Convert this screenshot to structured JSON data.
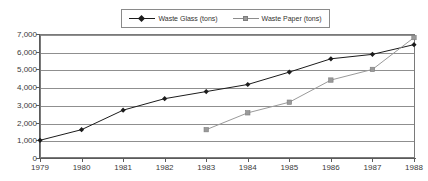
{
  "legend": {
    "position": "top-center",
    "entries": [
      {
        "label": "Waste Glass (tons)",
        "marker": "diamond-marker-icon",
        "color": "#1c1c1c"
      },
      {
        "label": "Waste Paper (tons)",
        "marker": "square-marker-icon",
        "color": "#9a9a9a"
      }
    ]
  },
  "chart_data": {
    "type": "line",
    "title": "",
    "subtitle": "",
    "xlabel": "",
    "ylabel": "",
    "x": [
      1979,
      1980,
      1981,
      1982,
      1983,
      1984,
      1985,
      1986,
      1987,
      1988
    ],
    "categories": [
      "1979",
      "1980",
      "1981",
      "1982",
      "1983",
      "1984",
      "1985",
      "1986",
      "1987",
      "1988"
    ],
    "xlim": [
      1979,
      1988
    ],
    "ylim": [
      0,
      7000
    ],
    "ytick_values": [
      0,
      1000,
      2000,
      3000,
      4000,
      5000,
      6000,
      7000
    ],
    "ytick_labels": [
      "0",
      "1,000",
      "2,000",
      "3,000",
      "4,000",
      "5,000",
      "6,000",
      "7,000"
    ],
    "grid": "horizontal",
    "legend_position": "top-center",
    "series": [
      {
        "name": "Waste Glass (tons)",
        "color": "#1c1c1c",
        "marker": "diamond",
        "values": [
          1000,
          1600,
          2700,
          3350,
          3750,
          4150,
          4850,
          5600,
          5850,
          6400
        ]
      },
      {
        "name": "Waste Paper (tons)",
        "color": "#9a9a9a",
        "marker": "square",
        "values": [
          null,
          null,
          null,
          null,
          1600,
          2550,
          3150,
          4400,
          5000,
          6800
        ]
      }
    ]
  }
}
